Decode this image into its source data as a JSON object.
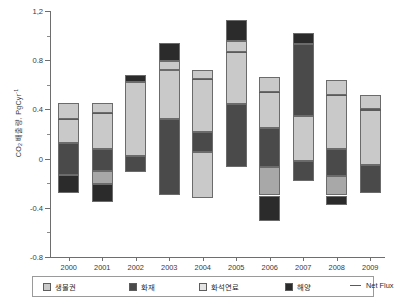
{
  "chart_data": {
    "type": "bar",
    "stacked": true,
    "title": "",
    "xlabel": "",
    "ylabel": "CO2 배출량, PgCyr-1",
    "ylabel_parts": {
      "prefix": "CO",
      "sub": "2",
      "mid": " 배출량, PgCyr",
      "sup": "-1"
    },
    "categories": [
      "2000",
      "2001",
      "2002",
      "2003",
      "2004",
      "2005",
      "2006",
      "2007",
      "2008",
      "2009"
    ],
    "ylim": [
      -0.8,
      1.2
    ],
    "yticks": [
      -0.8,
      -0.4,
      0,
      0.4,
      0.8,
      1.2
    ],
    "ytick_labels": [
      "-0.8",
      "-0.4",
      "0",
      "0.4",
      "0.8",
      "1,2"
    ],
    "yticks_minor": [
      -0.6,
      -0.2,
      0.2,
      0.6,
      1.0
    ],
    "grid": false,
    "legend_position": "bottom",
    "series": [
      {
        "name": "생물권",
        "color": "#c9c9c9",
        "values": [
          0.24,
          0.14,
          0.52,
          0.4,
          0.36,
          0.52,
          0.29,
          0.36,
          0.52,
          0.28
        ]
      },
      {
        "name": "화재",
        "color": "#4a4a4a",
        "values": [
          0.21,
          0.17,
          0.0,
          0.21,
          0.1,
          0.44,
          0.23,
          0.58,
          0.0,
          0.0
        ]
      },
      {
        "name": "화석연료",
        "color": "#a8a8a8",
        "values": [
          0.0,
          0.16,
          0.0,
          0.0,
          0.0,
          0.0,
          0.0,
          0.0,
          0.0,
          0.0
        ]
      },
      {
        "name": "해양",
        "color": "#2b2b2b",
        "values": [
          0.0,
          0.0,
          0.17,
          0.07,
          0.0,
          0.13,
          0.0,
          0.08,
          0.0,
          0.0
        ]
      }
    ],
    "negative_series": [
      {
        "name": "생물권",
        "color": "#c9c9c9",
        "values": [
          0.0,
          0.0,
          0.0,
          0.0,
          0.0,
          0.0,
          0.0,
          0.0,
          0.0,
          0.0
        ]
      },
      {
        "name": "화재",
        "color": "#4a4a4a",
        "values": [
          0.13,
          0.08,
          0.13,
          0.27,
          0.09,
          0.0,
          0.22,
          0.0,
          0.19,
          0.12
        ]
      },
      {
        "name": "화석연료",
        "color": "#a8a8a8",
        "values": [
          0.0,
          0.08,
          0.0,
          0.0,
          0.0,
          0.0,
          0.14,
          0.0,
          0.1,
          0.0
        ]
      },
      {
        "name": "해양",
        "color": "#2b2b2b",
        "values": [
          0.15,
          0.14,
          0.0,
          0.08,
          0.0,
          0.0,
          0.15,
          0.0,
          0.09,
          0.12
        ]
      }
    ],
    "net_flux": {
      "name": "Net Flux",
      "color": "#5a5a5a",
      "values": [
        0.32,
        0.37,
        0.62,
        0.72,
        0.6,
        0.94,
        0.54,
        0.92,
        0.62,
        0.42
      ]
    },
    "bars": [
      {
        "year": "2000",
        "top": 0.45,
        "bottom": -0.28,
        "segments": [
          [
            0.45,
            0.32,
            "#c9c9c9"
          ],
          [
            0.32,
            0.13,
            "#c9c9c9"
          ],
          [
            0.13,
            -0.13,
            "#4a4a4a"
          ],
          [
            -0.13,
            -0.28,
            "#2b2b2b"
          ]
        ]
      },
      {
        "year": "2001",
        "top": 0.45,
        "bottom": -0.35,
        "segments": [
          [
            0.45,
            0.37,
            "#c9c9c9"
          ],
          [
            0.37,
            0.08,
            "#c9c9c9"
          ],
          [
            0.08,
            -0.1,
            "#4a4a4a"
          ],
          [
            -0.1,
            -0.21,
            "#a8a8a8"
          ],
          [
            -0.21,
            -0.35,
            "#2b2b2b"
          ]
        ]
      },
      {
        "year": "2002",
        "top": 0.68,
        "bottom": -0.11,
        "segments": [
          [
            0.68,
            0.62,
            "#2b2b2b"
          ],
          [
            0.62,
            0.02,
            "#c9c9c9"
          ],
          [
            0.02,
            -0.11,
            "#4a4a4a"
          ]
        ]
      },
      {
        "year": "2003",
        "top": 0.94,
        "bottom": -0.3,
        "segments": [
          [
            0.94,
            0.79,
            "#2b2b2b"
          ],
          [
            0.79,
            0.72,
            "#c9c9c9"
          ],
          [
            0.72,
            0.32,
            "#c9c9c9"
          ],
          [
            0.32,
            -0.3,
            "#4a4a4a"
          ]
        ]
      },
      {
        "year": "2004",
        "top": 0.72,
        "bottom": -0.32,
        "segments": [
          [
            0.72,
            0.65,
            "#c9c9c9"
          ],
          [
            0.65,
            0.22,
            "#c9c9c9"
          ],
          [
            0.22,
            0.05,
            "#4a4a4a"
          ],
          [
            0.05,
            -0.32,
            "#c9c9c9"
          ]
        ]
      },
      {
        "year": "2005",
        "top": 1.13,
        "bottom": -0.07,
        "segments": [
          [
            1.13,
            0.96,
            "#2b2b2b"
          ],
          [
            0.96,
            0.87,
            "#c9c9c9"
          ],
          [
            0.87,
            0.44,
            "#c9c9c9"
          ],
          [
            0.44,
            -0.07,
            "#4a4a4a"
          ]
        ]
      },
      {
        "year": "2006",
        "top": 0.66,
        "bottom": -0.51,
        "segments": [
          [
            0.66,
            0.54,
            "#c9c9c9"
          ],
          [
            0.54,
            0.25,
            "#c9c9c9"
          ],
          [
            0.25,
            -0.07,
            "#4a4a4a"
          ],
          [
            -0.07,
            -0.3,
            "#a8a8a8"
          ],
          [
            -0.3,
            -0.51,
            "#2b2b2b"
          ]
        ]
      },
      {
        "year": "2007",
        "top": 1.02,
        "bottom": -0.18,
        "segments": [
          [
            1.02,
            0.93,
            "#2b2b2b"
          ],
          [
            0.93,
            0.35,
            "#4a4a4a"
          ],
          [
            0.35,
            -0.02,
            "#c9c9c9"
          ],
          [
            -0.02,
            -0.18,
            "#4a4a4a"
          ]
        ]
      },
      {
        "year": "2008",
        "top": 0.64,
        "bottom": -0.38,
        "segments": [
          [
            0.64,
            0.52,
            "#c9c9c9"
          ],
          [
            0.52,
            0.08,
            "#c9c9c9"
          ],
          [
            0.08,
            -0.14,
            "#4a4a4a"
          ],
          [
            -0.14,
            -0.3,
            "#a8a8a8"
          ],
          [
            -0.3,
            -0.38,
            "#2b2b2b"
          ]
        ]
      },
      {
        "year": "2009",
        "top": 0.52,
        "bottom": -0.28,
        "segments": [
          [
            0.52,
            0.4,
            "#c9c9c9"
          ],
          [
            0.4,
            -0.05,
            "#c9c9c9"
          ],
          [
            -0.05,
            -0.28,
            "#4a4a4a"
          ]
        ]
      }
    ],
    "net_flux_marks": [
      {
        "year": "2000",
        "value": 0.32
      },
      {
        "year": "2001",
        "value": 0.37
      },
      {
        "year": "2004",
        "value": 0.65
      },
      {
        "year": "2005",
        "value": 0.87
      },
      {
        "year": "2006",
        "value": 0.54
      },
      {
        "year": "2008",
        "value": 0.52
      },
      {
        "year": "2009",
        "value": 0.4
      }
    ]
  },
  "legend": {
    "items": [
      {
        "label": "생물권",
        "color": "#c9c9c9",
        "kind": "swatch"
      },
      {
        "label": "화재",
        "color": "#4a4a4a",
        "kind": "swatch"
      },
      {
        "label": "화석연료",
        "color": "#e4e4e4",
        "kind": "swatch"
      },
      {
        "label": "해양",
        "color": "#2b2b2b",
        "kind": "swatch"
      },
      {
        "label": "Net Flux",
        "color": "#5a5a5a",
        "kind": "line"
      }
    ]
  }
}
